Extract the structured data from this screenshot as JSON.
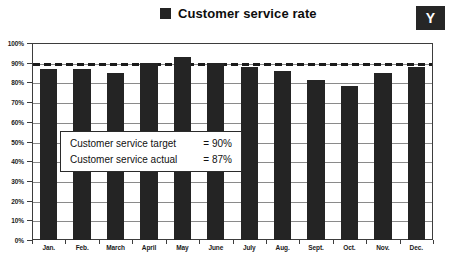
{
  "badge": {
    "label": "Y"
  },
  "legend": {
    "swatch_name": "legend-color-swatch",
    "label": "Customer service rate",
    "color": "#242424"
  },
  "annotation": {
    "line1_text": "Customer service target",
    "line1_value": "= 90%",
    "line2_text": "Customer service actual",
    "line2_value": "= 87%"
  },
  "chart_data": {
    "type": "bar",
    "title": "Customer service rate",
    "xlabel": "",
    "ylabel": "",
    "ylim": [
      0,
      100
    ],
    "ytick_labels": [
      "100%",
      "90%",
      "80%",
      "70%",
      "60%",
      "50%",
      "40%",
      "30%",
      "20%",
      "10%",
      "0%"
    ],
    "ytick_values": [
      100,
      90,
      80,
      70,
      60,
      50,
      40,
      30,
      20,
      10,
      0
    ],
    "grid": true,
    "legend_position": "top-center",
    "bar_color": "#242424",
    "categories": [
      "Jan.",
      "Feb.",
      "March",
      "April",
      "May",
      "June",
      "July",
      "Aug.",
      "Sept.",
      "Oct.",
      "Nov.",
      "Dec."
    ],
    "values": [
      87,
      87,
      85,
      90,
      93,
      90,
      88,
      86,
      81,
      78,
      85,
      88
    ],
    "series": [
      {
        "name": "Customer service rate",
        "values": [
          87,
          87,
          85,
          90,
          93,
          90,
          88,
          86,
          81,
          78,
          85,
          88
        ]
      }
    ],
    "target_line": {
      "label": "Customer service target",
      "value": 90,
      "style": "dashed",
      "color": "#1a1a1a"
    },
    "annotations": [
      "Customer service target  = 90%",
      "Customer service actual = 87%"
    ]
  }
}
